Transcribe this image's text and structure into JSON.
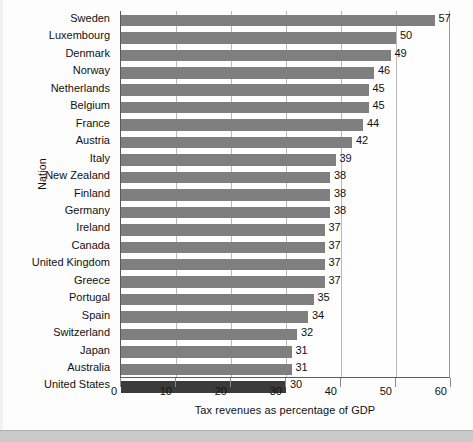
{
  "chart_data": {
    "type": "bar",
    "orientation": "horizontal",
    "title": "",
    "xlabel": "Tax revenues as percentage of GDP",
    "ylabel": "Nation",
    "xlim": [
      0,
      60
    ],
    "xticks": [
      0,
      10,
      20,
      30,
      40,
      50,
      60
    ],
    "xtick_labels": [
      "0",
      "10",
      "20",
      "30",
      "40",
      "50",
      "60"
    ],
    "grid": "vertical",
    "legend": "none",
    "categories": [
      "Sweden",
      "Luxembourg",
      "Denmark",
      "Norway",
      "Netherlands",
      "Belgium",
      "France",
      "Austria",
      "Italy",
      "New Zealand",
      "Finland",
      "Germany",
      "Ireland",
      "Canada",
      "United Kingdom",
      "Greece",
      "Portugal",
      "Spain",
      "Switzerland",
      "Japan",
      "Australia",
      "United States"
    ],
    "values": [
      57,
      50,
      49,
      46,
      45,
      45,
      44,
      42,
      39,
      38,
      38,
      38,
      37,
      37,
      37,
      37,
      35,
      34,
      32,
      31,
      31,
      30
    ],
    "value_labels": [
      "57",
      "50",
      "49",
      "46",
      "45",
      "45",
      "44",
      "42",
      "39",
      "38",
      "38",
      "38",
      "37",
      "37",
      "37",
      "37",
      "35",
      "34",
      "32",
      "31",
      "31",
      "30"
    ],
    "highlighted_category": "United States",
    "colors": {
      "bar": "#7f7f7f",
      "bar_highlight": "#3b3b3b",
      "gridline": "#b9b9b9",
      "axis": "#5a5a5a",
      "text": "#111111",
      "background": "#fdfdfd"
    }
  }
}
